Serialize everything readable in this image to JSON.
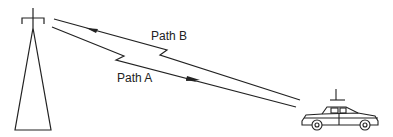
{
  "diagram": {
    "type": "multipath-propagation",
    "labels": {
      "path_a": "Path A",
      "path_b": "Path B"
    },
    "nodes": [
      {
        "id": "tower",
        "kind": "antenna-tower",
        "role": "base-station"
      },
      {
        "id": "car",
        "kind": "vehicle-with-antenna",
        "role": "mobile-receiver"
      }
    ],
    "edges": [
      {
        "id": "path_a",
        "from": "tower",
        "to": "car",
        "label": "Path A",
        "arrow_direction": "toward-car"
      },
      {
        "id": "path_b",
        "from": "car",
        "to": "tower",
        "label": "Path B",
        "arrow_direction": "toward-tower"
      }
    ],
    "colors": {
      "line": "#222222",
      "background": "#ffffff"
    }
  }
}
